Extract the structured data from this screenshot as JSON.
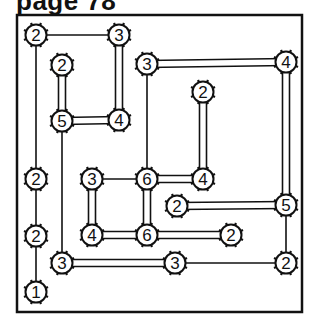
{
  "title": "page 78",
  "puzzle": {
    "type": "hashi",
    "frame": {
      "x": 17,
      "y": 15,
      "w": 285,
      "h": 297
    },
    "nodes": [
      {
        "id": "n1",
        "x": 36,
        "y": 35,
        "value": "2"
      },
      {
        "id": "n2",
        "x": 119,
        "y": 35,
        "value": "3"
      },
      {
        "id": "n3",
        "x": 62,
        "y": 65,
        "value": "2"
      },
      {
        "id": "n4",
        "x": 147,
        "y": 64,
        "value": "3"
      },
      {
        "id": "n5",
        "x": 286,
        "y": 62,
        "value": "4"
      },
      {
        "id": "n6",
        "x": 203,
        "y": 92,
        "value": "2"
      },
      {
        "id": "n7",
        "x": 62,
        "y": 121,
        "value": "5"
      },
      {
        "id": "n8",
        "x": 119,
        "y": 120,
        "value": "4"
      },
      {
        "id": "n9",
        "x": 36,
        "y": 179,
        "value": "2"
      },
      {
        "id": "n10",
        "x": 92,
        "y": 179,
        "value": "3"
      },
      {
        "id": "n11",
        "x": 147,
        "y": 179,
        "value": "6"
      },
      {
        "id": "n12",
        "x": 203,
        "y": 179,
        "value": "4"
      },
      {
        "id": "n13",
        "x": 177,
        "y": 206,
        "value": "2"
      },
      {
        "id": "n14",
        "x": 286,
        "y": 205,
        "value": "5"
      },
      {
        "id": "n15",
        "x": 36,
        "y": 236,
        "value": "2"
      },
      {
        "id": "n16",
        "x": 92,
        "y": 235,
        "value": "4"
      },
      {
        "id": "n17",
        "x": 147,
        "y": 235,
        "value": "6"
      },
      {
        "id": "n18",
        "x": 231,
        "y": 235,
        "value": "2"
      },
      {
        "id": "n19",
        "x": 62,
        "y": 263,
        "value": "3"
      },
      {
        "id": "n20",
        "x": 175,
        "y": 263,
        "value": "3"
      },
      {
        "id": "n21",
        "x": 286,
        "y": 263,
        "value": "2"
      },
      {
        "id": "n22",
        "x": 36,
        "y": 292,
        "value": "1"
      }
    ],
    "bridges": [
      {
        "from": "n1",
        "to": "n2",
        "count": 1
      },
      {
        "from": "n1",
        "to": "n9",
        "count": 1
      },
      {
        "from": "n2",
        "to": "n8",
        "count": 2
      },
      {
        "from": "n3",
        "to": "n7",
        "count": 2
      },
      {
        "from": "n7",
        "to": "n8",
        "count": 2
      },
      {
        "from": "n7",
        "to": "n19",
        "count": 1
      },
      {
        "from": "n4",
        "to": "n5",
        "count": 2
      },
      {
        "from": "n4",
        "to": "n11",
        "count": 1
      },
      {
        "from": "n5",
        "to": "n14",
        "count": 2
      },
      {
        "from": "n6",
        "to": "n12",
        "count": 2
      },
      {
        "from": "n10",
        "to": "n11",
        "count": 1
      },
      {
        "from": "n10",
        "to": "n16",
        "count": 2
      },
      {
        "from": "n11",
        "to": "n12",
        "count": 2
      },
      {
        "from": "n11",
        "to": "n17",
        "count": 2
      },
      {
        "from": "n13",
        "to": "n14",
        "count": 2
      },
      {
        "from": "n16",
        "to": "n17",
        "count": 2
      },
      {
        "from": "n17",
        "to": "n18",
        "count": 2
      },
      {
        "from": "n9",
        "to": "n15",
        "count": 1
      },
      {
        "from": "n15",
        "to": "n22",
        "count": 1
      },
      {
        "from": "n19",
        "to": "n20",
        "count": 2
      },
      {
        "from": "n20",
        "to": "n21",
        "count": 1
      },
      {
        "from": "n14",
        "to": "n21",
        "count": 1
      }
    ],
    "colors": {
      "ink": "#111111",
      "paper": "#ffffff"
    }
  }
}
